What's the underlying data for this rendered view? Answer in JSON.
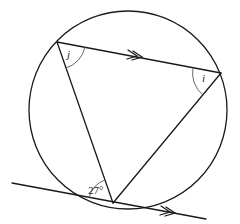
{
  "diagram": {
    "type": "circle-theorem",
    "circle": {
      "cx": 128,
      "cy": 110,
      "r": 99
    },
    "points": {
      "top_left": {
        "x": 57,
        "y": 42
      },
      "right": {
        "x": 221,
        "y": 73
      },
      "bottom": {
        "x": 113,
        "y": 203
      }
    },
    "tangent": {
      "x1": 12,
      "y1": 183,
      "x2": 206,
      "y2": 219
    },
    "labels": {
      "angle_j": "j",
      "angle_i": "i",
      "angle_given": "27°"
    },
    "parallel_marker": "double-arrow",
    "colors": {
      "line": "#1a1a1a",
      "arc": "#555555",
      "background": "#ffffff"
    }
  }
}
